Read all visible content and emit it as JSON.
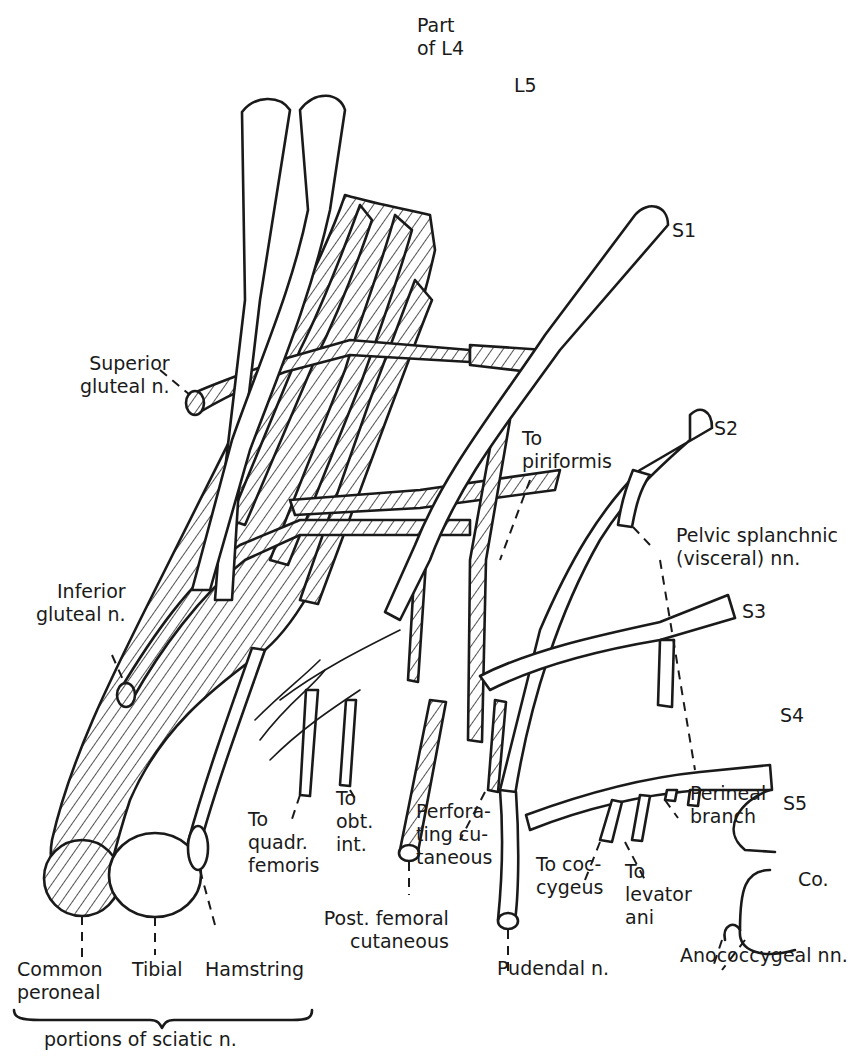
{
  "diagram": {
    "roots": [
      {
        "id": "l4",
        "label_line1": "Part",
        "label_line2": "of L4"
      },
      {
        "id": "l5",
        "label": "L5"
      },
      {
        "id": "s1",
        "label": "S1"
      },
      {
        "id": "s2",
        "label": "S2"
      },
      {
        "id": "s3",
        "label": "S3"
      },
      {
        "id": "s4",
        "label": "S4"
      },
      {
        "id": "s5",
        "label": "S5"
      },
      {
        "id": "co",
        "label": "Co."
      }
    ],
    "branches": {
      "superior_gluteal": {
        "line1": "Superior",
        "line2": "gluteal n."
      },
      "inferior_gluteal": {
        "line1": "Inferior",
        "line2": "gluteal n."
      },
      "to_piriformis": {
        "line1": "To",
        "line2": "piriformis"
      },
      "pelvic_splanchnic": {
        "line1": "Pelvic splanchnic",
        "line2": "(visceral) nn."
      },
      "to_quadr_femoris": {
        "line1": "To",
        "line2": "quadr.",
        "line3": "femoris"
      },
      "to_obt_int": {
        "line1": "To",
        "line2": "obt.",
        "line3": "int."
      },
      "perforating_cutaneous": {
        "line1": "Perfora-",
        "line2": "ting cu-",
        "line3": "taneous"
      },
      "perineal_branch": {
        "line1": "Perineal",
        "line2": "branch"
      },
      "to_coccygeus": {
        "line1": "To coc-",
        "line2": "cygeus"
      },
      "to_levator_ani": {
        "line1": "To",
        "line2": "levator",
        "line3": "ani"
      },
      "post_femoral_cutaneous": {
        "line1": "Post. femoral",
        "line2": "cutaneous"
      },
      "pudendal": {
        "label": "Pudendal n."
      },
      "anococcygeal": {
        "label": "Anococcygeal nn."
      }
    },
    "sciatic_portions": {
      "common_peroneal": {
        "line1": "Common",
        "line2": "peroneal"
      },
      "tibial": {
        "label": "Tibial"
      },
      "hamstring": {
        "label": "Hamstring"
      },
      "group_caption": "portions of sciatic n."
    },
    "legend_key": {
      "hatched": "dorsal (posterior) divisions",
      "white": "ventral (anterior) divisions"
    },
    "colors": {
      "ink": "#1a1a1a",
      "paper": "#ffffff"
    }
  }
}
